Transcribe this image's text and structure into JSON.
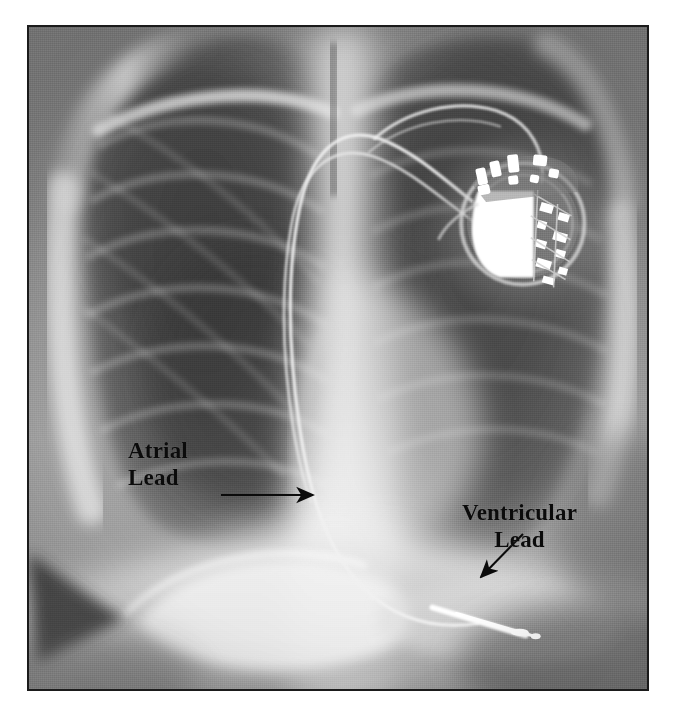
{
  "figure": {
    "modality": "chest-radiograph",
    "view": "frontal",
    "border_color": "#1b1b1b",
    "background_color": "#ffffff"
  },
  "annotations": [
    {
      "id": "atrial",
      "label_line1": "Atrial",
      "label_line2": "Lead",
      "arrow": "horizontal-right",
      "target": "atrial-lead-tip"
    },
    {
      "id": "ventricular",
      "label_line1": "Ventricular",
      "label_line2": "Lead",
      "arrow": "diagonal-down-left",
      "target": "ventricular-lead-tip"
    }
  ],
  "anatomy": {
    "pacemaker_generator": "pulse-generator",
    "leads": [
      "atrial-lead",
      "ventricular-lead"
    ],
    "fields": [
      "right-lung",
      "left-lung",
      "mediastinum",
      "diaphragm",
      "rib-cage"
    ]
  },
  "colors": {
    "film_dark": "#3a3a3a",
    "film_mid": "#8d8d8d",
    "film_bright": "#ededed",
    "device_metal": "#ffffff",
    "ink": "#0b0b0b"
  }
}
